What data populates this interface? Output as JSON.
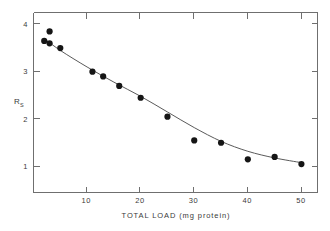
{
  "chart_data": {
    "type": "scatter",
    "title": "",
    "xlabel": "TOTAL LOAD  (mg protein)",
    "ylabel": "R",
    "ylabel_subscript": "S",
    "xlim": [
      0,
      53
    ],
    "ylim": [
      0.55,
      4.35
    ],
    "xticks": [
      10,
      20,
      30,
      40,
      50
    ],
    "xtick_labels": [
      "10",
      "20",
      "30",
      "40",
      "50"
    ],
    "yticks": [
      1,
      2,
      3,
      4
    ],
    "ytick_labels": [
      "1",
      "2",
      "3",
      "4"
    ],
    "grid": false,
    "legend": null,
    "x": [
      2,
      3,
      3,
      5,
      11,
      13,
      16,
      20,
      25,
      30,
      35,
      40,
      45,
      50
    ],
    "values": [
      3.75,
      3.95,
      3.7,
      3.6,
      3.1,
      3.0,
      2.8,
      2.55,
      2.15,
      1.65,
      1.6,
      1.25,
      1.3,
      1.15
    ],
    "series": [
      {
        "name": "data points",
        "x": [
          2,
          3,
          3,
          5,
          11,
          13,
          16,
          20,
          25,
          30,
          35,
          40,
          45,
          50
        ],
        "values": [
          3.75,
          3.95,
          3.7,
          3.6,
          3.1,
          3.0,
          2.8,
          2.55,
          2.15,
          1.65,
          1.6,
          1.25,
          1.3,
          1.15
        ]
      },
      {
        "name": "fitted curve",
        "x": [
          2,
          5,
          10,
          15,
          20,
          25,
          30,
          35,
          40,
          45,
          50
        ],
        "values": [
          3.8,
          3.55,
          3.2,
          2.88,
          2.58,
          2.25,
          1.92,
          1.63,
          1.42,
          1.28,
          1.18
        ]
      }
    ],
    "marker_color": "#151515",
    "line_color": "#5a5a5a",
    "axis_color": "#6f6f6f"
  }
}
